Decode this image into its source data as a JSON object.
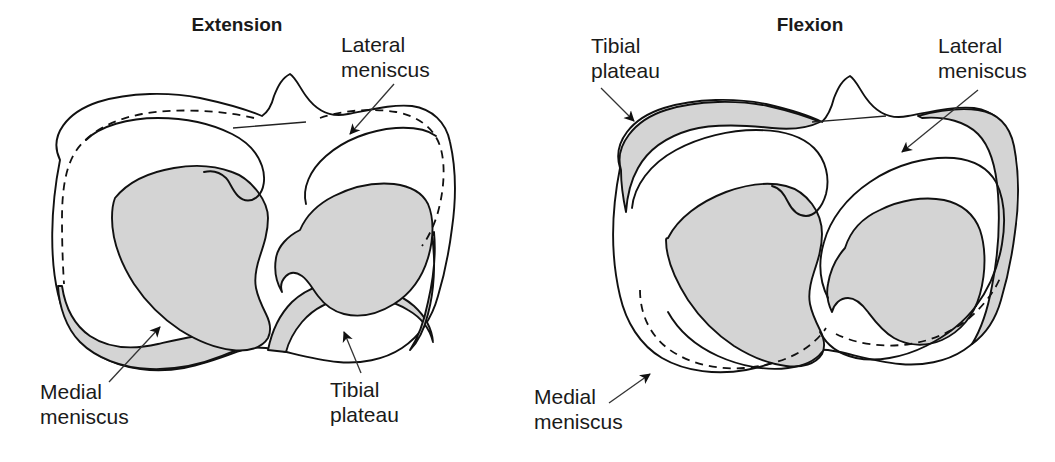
{
  "figure": {
    "kind": "anatomical-diagram",
    "background_color": "#ffffff",
    "line_color": "#111111",
    "shade_color": "#d4d4d4"
  },
  "panels": [
    {
      "id": "extension",
      "title": "Extension",
      "annotations": [
        {
          "id": "lateral-meniscus",
          "label_line1": "Lateral",
          "label_line2": "meniscus"
        },
        {
          "id": "medial-meniscus",
          "label_line1": "Medial",
          "label_line2": "meniscus"
        },
        {
          "id": "tibial-plateau",
          "label_line1": "Tibial",
          "label_line2": "plateau"
        }
      ]
    },
    {
      "id": "flexion",
      "title": "Flexion",
      "annotations": [
        {
          "id": "tibial-plateau",
          "label_line1": "Tibial",
          "label_line2": "plateau"
        },
        {
          "id": "lateral-meniscus",
          "label_line1": "Lateral",
          "label_line2": "meniscus"
        },
        {
          "id": "medial-meniscus",
          "label_line1": "Medial",
          "label_line2": "meniscus"
        }
      ]
    }
  ]
}
